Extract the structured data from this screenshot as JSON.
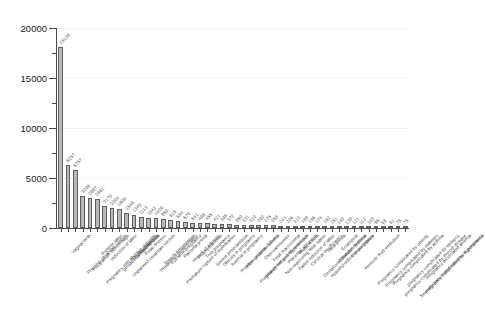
{
  "chart_data": {
    "type": "bar",
    "title": "",
    "subtitle": "",
    "xlabel": "",
    "ylabel": "",
    "ylim": [
      0,
      20000
    ],
    "yticks": [
      0,
      5000,
      10000,
      15000,
      20000
    ],
    "ytick_labels": [
      "0",
      "5000",
      "10000",
      "15000",
      "20000"
    ],
    "y_minor_ticks": [
      2500,
      7500,
      12500,
      17500
    ],
    "grid": true,
    "grid_axis": "y",
    "legend": "none",
    "bar_color": "#b9b9b9",
    "bar_edge_color": "#5d5d5d",
    "value_labels_rotated": true,
    "categories": [
      "Vaginal birth",
      "Previous cesarean section",
      "Postpartum hemorrhage",
      "Pregnancy with abortive outcome",
      "Preterm labor",
      "Induction of labor",
      "gestational hypertension",
      "Unplanned cesarean section",
      "Oligohydramnios",
      "Preeclampsia",
      "Fetal distress",
      "Threatened preterm labor",
      "Breech presentation",
      "Full term pregnancy",
      "Premature rupture of membranes",
      "Placenta previa",
      "History of infertility",
      "Polyhydramnios",
      "Twin pregnancy",
      "Severe preeclampsia",
      "Obesity in pregnancy",
      "Anemia in pregnancy",
      "Previous preterm delivery",
      "After cesarean section",
      "Pregnancy induced hypertension",
      "Intrauterine growth restriction",
      "Chorioamnionitis",
      "Fetal macrosomia",
      "Non-reassuring fetal status",
      "Placental abruption",
      "Failed induction of labor",
      "Preterm birth",
      "Cervical insufficiency",
      "Gestational diabetes mellitus",
      "Hypothyroidism in pregnancy",
      "Vasa previa",
      "Shoulder dystocia",
      "Eclampsia",
      "Uterine rupture",
      "Amniotic fluid embolism",
      "Pregnancy complicated by obesity",
      "Pregnancy complicated by diabetes",
      "Pregnancy complicated by asthma",
      "pregnancy complicated by thyroid disease",
      "pregnancy complicated by epilepsy",
      "Sexually transmitted infection in pregnancy",
      "pregnancy complicated by hypertension",
      "Pregnancy associated anemia"
    ],
    "values": [
      18138,
      6257,
      5757,
      3208,
      2997,
      2861,
      2170,
      2004,
      1906,
      1549,
      1345,
      1113,
      1042,
      1029,
      950,
      818,
      684,
      579,
      541,
      498,
      455,
      421,
      398,
      372,
      350,
      331,
      310,
      292,
      275,
      258,
      241,
      226,
      212,
      199,
      186,
      174,
      162,
      151,
      140,
      130,
      121,
      112,
      103,
      95,
      88,
      81,
      75,
      78
    ],
    "value_labels": [
      "18138",
      "6257",
      "5757",
      "3208",
      "2997",
      "2861",
      "2170",
      "2004",
      "1906",
      "1549",
      "1345",
      "1113",
      "1042",
      "1029",
      "950",
      "818",
      "684",
      "579",
      "541",
      "498",
      "455",
      "421",
      "398",
      "372",
      "350",
      "331",
      "310",
      "292",
      "275",
      "258",
      "241",
      "226",
      "212",
      "199",
      "186",
      "174",
      "162",
      "151",
      "140",
      "130",
      "121",
      "112",
      "103",
      "95",
      "88",
      "81",
      "75",
      "78"
    ]
  }
}
